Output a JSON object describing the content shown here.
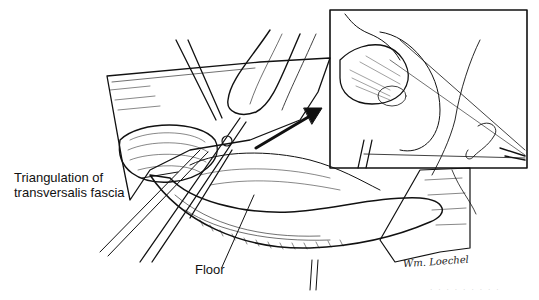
{
  "figure": {
    "labels": {
      "triangulation_line1": "Triangulation of",
      "triangulation_line2": "transversalis fascia",
      "floor": "Floor"
    },
    "signature": "Wm. Loechel",
    "faint_caption": "· · ·  · · ·  · ·  ·",
    "inset": {
      "present": true,
      "border_color": "#111111"
    },
    "colors": {
      "ink": "#111111",
      "paper": "#ffffff"
    }
  }
}
